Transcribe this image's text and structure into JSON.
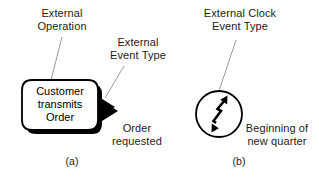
{
  "figure": {
    "background_color": "#ffffff",
    "ink_color": "#000000",
    "leader_line_color": "#9a9a9a"
  },
  "panel_a": {
    "caption": "(a)",
    "operation_label": "External\nOperation",
    "event_type_label": "External\nEvent Type",
    "operation_text": "Customer\ntransmits\nOrder",
    "event_name": "Order\nrequested",
    "shape": "rounded-rectangle-with-shadow",
    "arrow_shape": "solid-black-triangle"
  },
  "panel_b": {
    "caption": "(b)",
    "clock_event_label": "External Clock\nEvent Type",
    "event_name": "Beginning of\nnew quarter",
    "shape": "circle",
    "icon": "double-headed-zigzag-arrow"
  }
}
